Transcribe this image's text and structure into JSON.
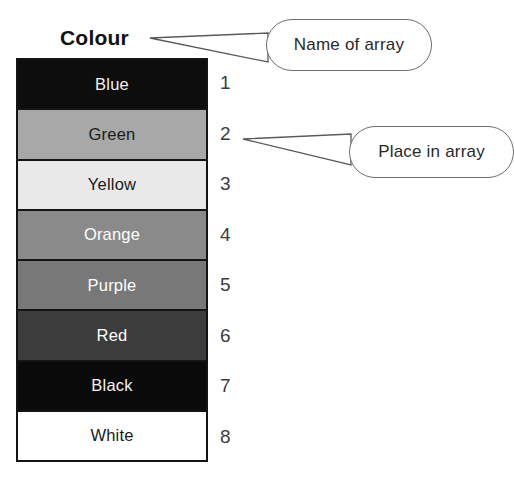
{
  "diagram": {
    "array_name_label": "Colour",
    "cells": [
      {
        "label": "Blue",
        "fill": "#0d0d0d",
        "text_color": "#f2f2f2",
        "index": "1"
      },
      {
        "label": "Green",
        "fill": "#a8a8a8",
        "text_color": "#1a1a1a",
        "index": "2"
      },
      {
        "label": "Yellow",
        "fill": "#e9e9e9",
        "text_color": "#1a1a1a",
        "index": "3"
      },
      {
        "label": "Orange",
        "fill": "#8a8a8a",
        "text_color": "#ffffff",
        "index": "4"
      },
      {
        "label": "Purple",
        "fill": "#787878",
        "text_color": "#ffffff",
        "index": "5"
      },
      {
        "label": "Red",
        "fill": "#3c3c3c",
        "text_color": "#ffffff",
        "index": "6"
      },
      {
        "label": "Black",
        "fill": "#0a0a0a",
        "text_color": "#f2f2f2",
        "index": "7"
      },
      {
        "label": "White",
        "fill": "#ffffff",
        "text_color": "#1a1a1a",
        "index": "8"
      }
    ],
    "callouts": [
      {
        "text": "Name of array",
        "points_to": "Colour"
      },
      {
        "text": "Place in array",
        "points_to": "2"
      }
    ],
    "colors": {
      "background": "#ffffff",
      "table_border": "#141414",
      "callout_border": "#6e6e6e",
      "leader_line": "#5a5a5a",
      "index_text": "#3c3c3c",
      "title_text": "#111111"
    }
  }
}
